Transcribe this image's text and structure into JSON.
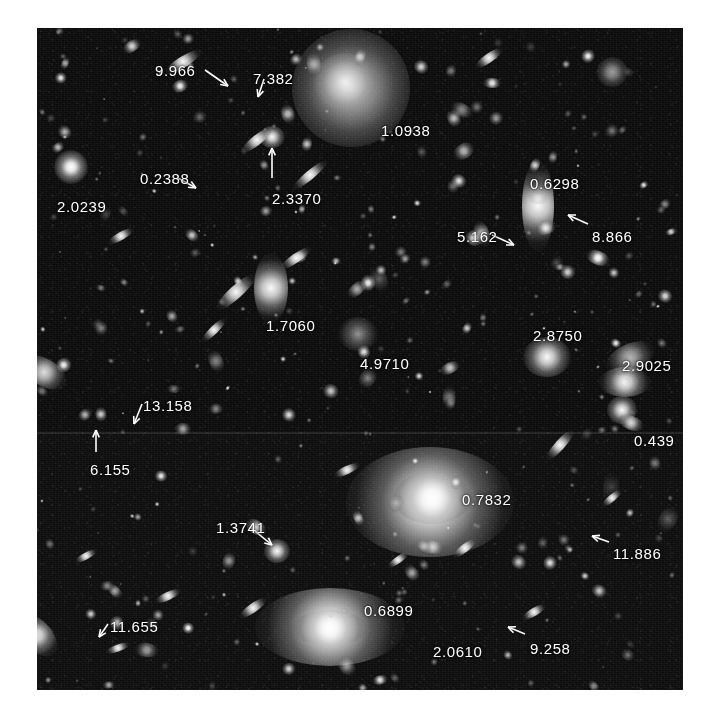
{
  "figure": {
    "kind": "astronomical-image-plate",
    "background_color": "#ffffff",
    "sky_color": "#0a0a0a",
    "label_color": "#ffffff",
    "plate": {
      "left": 37,
      "top": 28,
      "width": 646,
      "height": 662
    }
  },
  "annotations": [
    {
      "id": "a01",
      "value": "9.966",
      "x": 155,
      "y": 62,
      "arrow": {
        "from": [
          205,
          70
        ],
        "to": [
          228,
          86
        ]
      }
    },
    {
      "id": "a02",
      "value": "7.382",
      "x": 253,
      "y": 70,
      "arrow": {
        "from": [
          264,
          79
        ],
        "to": [
          258,
          97
        ]
      }
    },
    {
      "id": "a03",
      "value": "1.0938",
      "x": 381,
      "y": 122,
      "arrow": null
    },
    {
      "id": "a04",
      "value": "0.2388",
      "x": 140,
      "y": 170,
      "arrow": {
        "from": [
          178,
          178
        ],
        "to": [
          196,
          188
        ]
      }
    },
    {
      "id": "a05",
      "value": "2.0239",
      "x": 57,
      "y": 198,
      "arrow": null
    },
    {
      "id": "a06",
      "value": "2.3370",
      "x": 272,
      "y": 190,
      "arrow": {
        "from": [
          272,
          178
        ],
        "to": [
          272,
          148
        ]
      }
    },
    {
      "id": "a07",
      "value": "0.6298",
      "x": 530,
      "y": 175,
      "arrow": null
    },
    {
      "id": "a08",
      "value": "5.162",
      "x": 457,
      "y": 228,
      "arrow": {
        "from": [
          492,
          235
        ],
        "to": [
          514,
          245
        ]
      }
    },
    {
      "id": "a09",
      "value": "8.866",
      "x": 592,
      "y": 228,
      "arrow": {
        "from": [
          588,
          224
        ],
        "to": [
          568,
          215
        ]
      }
    },
    {
      "id": "a10",
      "value": "1.7060",
      "x": 266,
      "y": 317,
      "arrow": null
    },
    {
      "id": "a11",
      "value": "4.9710",
      "x": 360,
      "y": 355,
      "arrow": null
    },
    {
      "id": "a12",
      "value": "2.8750",
      "x": 533,
      "y": 327,
      "arrow": null
    },
    {
      "id": "a13",
      "value": "2.9025",
      "x": 622,
      "y": 357,
      "arrow": null
    },
    {
      "id": "a14",
      "value": "13.158",
      "x": 143,
      "y": 397,
      "arrow": {
        "from": [
          142,
          404
        ],
        "to": [
          134,
          424
        ]
      }
    },
    {
      "id": "a15",
      "value": "0.439",
      "x": 634,
      "y": 432,
      "arrow": null
    },
    {
      "id": "a16",
      "value": "6.155",
      "x": 90,
      "y": 461,
      "arrow": {
        "from": [
          96,
          452
        ],
        "to": [
          96,
          430
        ]
      }
    },
    {
      "id": "a17",
      "value": "0.7832",
      "x": 462,
      "y": 491,
      "arrow": null
    },
    {
      "id": "a18",
      "value": "1.3741",
      "x": 216,
      "y": 519,
      "arrow": {
        "from": [
          250,
          527
        ],
        "to": [
          272,
          545
        ]
      }
    },
    {
      "id": "a19",
      "value": "11.886",
      "x": 613,
      "y": 545,
      "arrow": {
        "from": [
          609,
          542
        ],
        "to": [
          592,
          536
        ]
      }
    },
    {
      "id": "a20",
      "value": "0.6899",
      "x": 364,
      "y": 602,
      "arrow": null
    },
    {
      "id": "a21",
      "value": "11.655",
      "x": 110,
      "y": 618,
      "arrow": {
        "from": [
          108,
          624
        ],
        "to": [
          99,
          637
        ]
      }
    },
    {
      "id": "a22",
      "value": "2.0610",
      "x": 433,
      "y": 643,
      "arrow": null
    },
    {
      "id": "a23",
      "value": "9.258",
      "x": 530,
      "y": 640,
      "arrow": {
        "from": [
          525,
          634
        ],
        "to": [
          508,
          627
        ]
      }
    }
  ],
  "objects": [
    {
      "id": "o-big-diffuse-top",
      "class": "diffuse",
      "x": 351,
      "y": 88,
      "w": 118,
      "h": 118
    },
    {
      "id": "o-core-top",
      "class": "diffuse",
      "x": 345,
      "y": 82,
      "w": 62,
      "h": 58
    },
    {
      "id": "o-bright-ell-mid",
      "class": "gal",
      "x": 430,
      "y": 502,
      "w": 168,
      "h": 110
    },
    {
      "id": "o-ell-core",
      "class": "star",
      "x": 432,
      "y": 498,
      "w": 78,
      "h": 52
    },
    {
      "id": "o-lower-ell",
      "class": "gal",
      "x": 330,
      "y": 627,
      "w": 150,
      "h": 78
    },
    {
      "id": "o-lower-ell-core",
      "class": "star",
      "x": 330,
      "y": 628,
      "w": 74,
      "h": 36
    },
    {
      "id": "o-spindle-0p6298",
      "class": "gal",
      "x": 538,
      "y": 206,
      "w": 32,
      "h": 92
    },
    {
      "id": "o-spindle-1p7060",
      "class": "gal",
      "x": 271,
      "y": 288,
      "w": 34,
      "h": 70
    },
    {
      "id": "o-star-2p0239",
      "class": "star",
      "x": 71,
      "y": 167,
      "w": 34,
      "h": 34
    },
    {
      "id": "o-blob-2p3370",
      "class": "gal",
      "x": 272,
      "y": 137,
      "w": 26,
      "h": 22
    },
    {
      "id": "o-blob-2p8750",
      "class": "gal",
      "x": 547,
      "y": 357,
      "w": 48,
      "h": 40
    },
    {
      "id": "o-blob-2p9025",
      "class": "gal",
      "x": 625,
      "y": 382,
      "w": 52,
      "h": 30
    },
    {
      "id": "o-blob-0p439",
      "class": "gal",
      "x": 622,
      "y": 410,
      "w": 30,
      "h": 28
    },
    {
      "id": "o-blob-4p9710",
      "class": "faint",
      "x": 358,
      "y": 334,
      "w": 40,
      "h": 34
    },
    {
      "id": "o-blob-1p3741",
      "class": "gal",
      "x": 277,
      "y": 551,
      "w": 26,
      "h": 24
    }
  ]
}
